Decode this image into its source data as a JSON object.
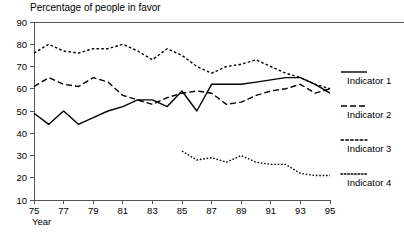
{
  "chart_data": {
    "type": "line",
    "title": "Percentage of people in favor",
    "xlabel": "Year",
    "ylabel": "",
    "xlim": [
      75,
      95
    ],
    "ylim": [
      10,
      90
    ],
    "xticks": [
      75,
      77,
      79,
      81,
      83,
      85,
      87,
      89,
      91,
      93,
      95
    ],
    "yticks": [
      10,
      20,
      30,
      40,
      50,
      60,
      70,
      80,
      90
    ],
    "xtick_labels": [
      "75",
      "77",
      "79",
      "81",
      "83",
      "85",
      "87",
      "89",
      "91",
      "93",
      "95"
    ],
    "ytick_labels": [
      "10",
      "20",
      "30",
      "40",
      "50",
      "60",
      "70",
      "80",
      "90"
    ],
    "grid": false,
    "legend_position": "right",
    "x": [
      75,
      76,
      77,
      78,
      79,
      80,
      81,
      82,
      83,
      84,
      85,
      86,
      87,
      88,
      89,
      90,
      91,
      92,
      93,
      94,
      95
    ],
    "series": [
      {
        "name": "Indicator 1",
        "dash": "none",
        "x": [
          75,
          76,
          77,
          78,
          79,
          80,
          81,
          82,
          83,
          84,
          85,
          86,
          87,
          88,
          89,
          90,
          91,
          92,
          93,
          94,
          95
        ],
        "values": [
          49,
          44,
          50,
          44,
          47,
          50,
          52,
          55,
          55,
          52,
          59,
          50,
          62,
          62,
          62,
          63,
          64,
          65,
          65,
          62,
          58
        ]
      },
      {
        "name": "Indicator 2",
        "dash": "dash",
        "x": [
          75,
          76,
          77,
          78,
          79,
          80,
          81,
          82,
          83,
          84,
          85,
          86,
          87,
          88,
          89,
          90,
          91,
          92,
          93,
          94,
          95
        ],
        "values": [
          61,
          65,
          62,
          61,
          65,
          63,
          57,
          55,
          53,
          56,
          58,
          59,
          58,
          53,
          54,
          57,
          59,
          60,
          62,
          58,
          60
        ]
      },
      {
        "name": "Indicator 3",
        "dash": "dot-dense",
        "x": [
          75,
          76,
          77,
          78,
          79,
          80,
          81,
          82,
          83,
          84,
          85,
          86,
          87,
          88,
          89,
          90,
          91,
          92,
          93,
          94,
          95
        ],
        "values": [
          76,
          80,
          77,
          76,
          78,
          78,
          80,
          77,
          73,
          78,
          75,
          70,
          67,
          70,
          71,
          73,
          70,
          67,
          65,
          62,
          60
        ]
      },
      {
        "name": "Indicator 4",
        "dash": "dot-fine",
        "x": [
          85,
          86,
          87,
          88,
          89,
          90,
          91,
          92,
          93,
          94,
          95
        ],
        "values": [
          32,
          28,
          29,
          27,
          30,
          27,
          26,
          26,
          22,
          21,
          21
        ]
      }
    ],
    "legend": [
      {
        "label": "Indicator 1",
        "dash": "none"
      },
      {
        "label": "Indicator 2",
        "dash": "dash"
      },
      {
        "label": "Indicator 3",
        "dash": "dot-dense"
      },
      {
        "label": "Indicator 4",
        "dash": "dot-fine"
      }
    ]
  }
}
